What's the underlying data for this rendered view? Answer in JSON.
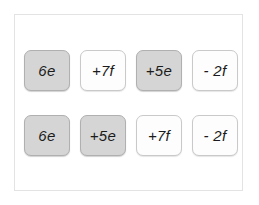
{
  "panel": {
    "name": "algebra-tile-panel",
    "border_color": "#e3e3e3",
    "background": "#ffffff"
  },
  "styles": {
    "shaded_fill": "#d5d5d5",
    "shaded_border": "#b0b0b0",
    "plain_fill": "#fdfdfd",
    "plain_border": "#c9c9c9",
    "text_color": "#1b1b1b"
  },
  "rows": [
    {
      "name": "original-expression",
      "tiles": [
        {
          "label": "6e",
          "shaded": true
        },
        {
          "label": "+7f",
          "shaded": false
        },
        {
          "label": "+5e",
          "shaded": true
        },
        {
          "label": "- 2f",
          "shaded": false
        }
      ]
    },
    {
      "name": "rearranged-expression",
      "tiles": [
        {
          "label": "6e",
          "shaded": true
        },
        {
          "label": "+5e",
          "shaded": true
        },
        {
          "label": "+7f",
          "shaded": false
        },
        {
          "label": "- 2f",
          "shaded": false
        }
      ]
    }
  ]
}
